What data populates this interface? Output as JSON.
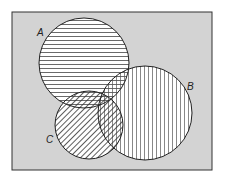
{
  "diagram": {
    "type": "venn",
    "universe_fill": "#d3d3d3",
    "sets": [
      {
        "id": "A",
        "label": "A",
        "hatch": "horizontal"
      },
      {
        "id": "B",
        "label": "B",
        "hatch": "vertical"
      },
      {
        "id": "C",
        "label": "C",
        "hatch": "diagonal"
      }
    ]
  }
}
